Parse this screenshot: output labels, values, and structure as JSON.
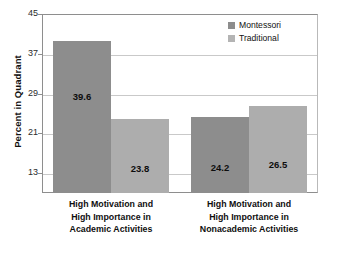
{
  "chart_data": {
    "type": "bar",
    "title": "",
    "subtitle": "",
    "xlabel": "",
    "ylabel": "Percent in Quadrant",
    "ylim": [
      9,
      45
    ],
    "yticks": [
      13,
      21,
      29,
      37,
      45
    ],
    "grid": true,
    "legend_position": "top-right",
    "categories": [
      "High Motivation and High Importance in Academic Activities",
      "High Motivation and High Importance in Nonacademic Activities"
    ],
    "category_lines": [
      [
        "High Motivation and",
        "High Importance in",
        "Academic Activities"
      ],
      [
        "High Motivation and",
        "High Importance in",
        "Nonacademic Activities"
      ]
    ],
    "series": [
      {
        "name": "Montessori",
        "color": "#8d8d8d",
        "values": [
          39.6,
          24.2
        ],
        "labels": [
          "39.6",
          "24.2"
        ]
      },
      {
        "name": "Traditional",
        "color": "#adadad",
        "values": [
          23.8,
          26.5
        ],
        "labels": [
          "23.8",
          "26.5"
        ]
      }
    ]
  },
  "axis": {
    "y_title": "Percent in Quadrant",
    "y_tick_labels": [
      "45",
      "37",
      "29",
      "21",
      "13"
    ]
  },
  "legend": {
    "items": [
      {
        "label": "Montessori",
        "color": "#8d8d8d"
      },
      {
        "label": "Traditional",
        "color": "#b4b4b4"
      }
    ]
  }
}
